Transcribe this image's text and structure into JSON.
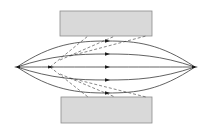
{
  "diagram": {
    "background": "#ffffff",
    "colors": {
      "plate_fill": "#d9d9d9",
      "plate_stroke": "#8c8c8c",
      "line": "#3a3a3a",
      "dashed": "#555555",
      "marker": "#1a1a1a"
    },
    "plates": [
      {
        "id": "top-plate",
        "x": 60,
        "y": 11,
        "w": 92,
        "h": 25
      },
      {
        "id": "bottom-plate",
        "x": 61,
        "y": 97,
        "w": 91,
        "h": 26
      }
    ],
    "source_point": {
      "x": 17,
      "y": 67
    },
    "focus_point": {
      "x": 195,
      "y": 67
    },
    "trajectories": [
      {
        "mid_y": 41,
        "marker_x": 107
      },
      {
        "mid_y": 54,
        "marker_x": 107
      },
      {
        "mid_y": 67,
        "marker_x": 107
      },
      {
        "mid_y": 80,
        "marker_x": 107
      },
      {
        "mid_y": 93,
        "marker_x": 107
      }
    ],
    "dashed_lines": [
      {
        "x1": 50,
        "y1": 67,
        "x2": 88,
        "y2": 36
      },
      {
        "x1": 60,
        "y1": 60,
        "x2": 115,
        "y2": 36
      },
      {
        "x1": 70,
        "y1": 56,
        "x2": 146,
        "y2": 36
      },
      {
        "x1": 50,
        "y1": 67,
        "x2": 88,
        "y2": 97
      },
      {
        "x1": 60,
        "y1": 74,
        "x2": 115,
        "y2": 97
      },
      {
        "x1": 70,
        "y1": 78,
        "x2": 146,
        "y2": 97
      }
    ]
  }
}
